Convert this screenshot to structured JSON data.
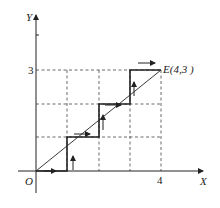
{
  "diagram": {
    "type": "step-path-on-grid",
    "axes": {
      "x_label": "X",
      "y_label": "Y",
      "origin_label": "O",
      "x_tick_label": "4",
      "y_tick_label": "3"
    },
    "grid": {
      "x_divisions": 4,
      "y_divisions": 3,
      "style": "dashed"
    },
    "diagonal": {
      "from": [
        0,
        0
      ],
      "to": [
        4,
        3
      ]
    },
    "endpoint_label": "E(4,3 )",
    "step_path": [
      [
        0,
        0
      ],
      [
        1,
        0
      ],
      [
        1,
        1
      ],
      [
        2,
        1
      ],
      [
        2,
        2
      ],
      [
        3,
        2
      ],
      [
        3,
        3
      ],
      [
        4,
        3
      ]
    ],
    "arrows": [
      {
        "dir": "right",
        "at": [
          0.5,
          0
        ]
      },
      {
        "dir": "up",
        "at": [
          1.1,
          0.5
        ]
      },
      {
        "dir": "right",
        "at": [
          1.5,
          1.1
        ]
      },
      {
        "dir": "up",
        "at": [
          2.1,
          1.5
        ]
      },
      {
        "dir": "right",
        "at": [
          2.5,
          2
        ]
      },
      {
        "dir": "up",
        "at": [
          3.1,
          2.5
        ]
      },
      {
        "dir": "right",
        "at": [
          3.5,
          3.2
        ]
      }
    ],
    "colors": {
      "line": "#222222",
      "grid": "#444444",
      "background": "#ffffff"
    }
  }
}
